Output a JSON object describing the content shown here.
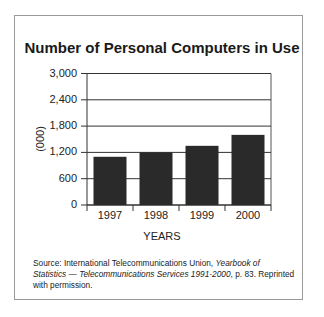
{
  "chart_data": {
    "type": "bar",
    "title": "Number of Personal Computers in Use",
    "categories": [
      "1997",
      "1998",
      "1999",
      "2000"
    ],
    "values": [
      1100,
      1200,
      1350,
      1600
    ],
    "xlabel": "YEARS",
    "ylabel": "(000)",
    "ylim": [
      0,
      3000
    ],
    "yticks": [
      0,
      600,
      1200,
      1800,
      2400,
      3000
    ],
    "ytick_labels": [
      "0",
      "600",
      "1,200",
      "1,800",
      "2,400",
      "3,000"
    ],
    "grid": true,
    "legend": null,
    "bar_color": "#2a2a2a"
  },
  "source": {
    "prefix": "Source: International Telecommunications Union,",
    "title_italic_1": "Yearbook of Statistics",
    "dash": "—",
    "title_italic_2": "Telecommunications Services 1991-2000",
    "suffix": ", p. 83. Reprinted with permission."
  }
}
